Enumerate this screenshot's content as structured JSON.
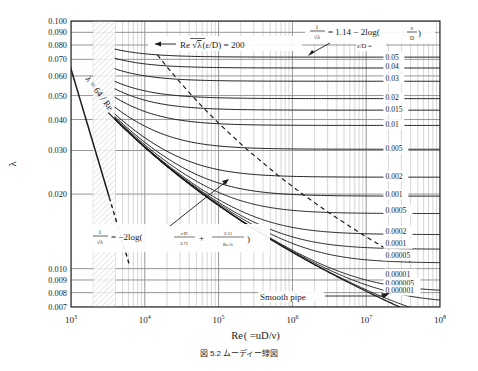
{
  "figure": {
    "caption": "図 5.2  ムーディー線図",
    "xlabel_re": "Re",
    "xlabel_rest": "( =uD/ν)",
    "ylabel": "λ"
  },
  "axes": {
    "x_ticks": [
      {
        "base": "10",
        "exp": "3",
        "value": 1000
      },
      {
        "base": "10",
        "exp": "4",
        "value": 10000
      },
      {
        "base": "10",
        "exp": "5",
        "value": 100000
      },
      {
        "base": "10",
        "exp": "6",
        "value": 1000000
      },
      {
        "base": "10",
        "exp": "7",
        "value": 10000000
      },
      {
        "base": "10",
        "exp": "8",
        "value": 100000000
      }
    ],
    "xlim": [
      1000,
      100000000
    ],
    "ylim": [
      0.007,
      0.1
    ],
    "y_ticks": [
      {
        "label": "0.100",
        "value": 0.1
      },
      {
        "label": "0.090",
        "value": 0.09
      },
      {
        "label": "0.080",
        "value": 0.08
      },
      {
        "label": "0.070",
        "value": 0.07
      },
      {
        "label": "0.060",
        "value": 0.06
      },
      {
        "label": "0.050",
        "value": 0.05
      },
      {
        "label": "0.040",
        "value": 0.04
      },
      {
        "label": "0.030",
        "value": 0.03
      },
      {
        "label": "0.020",
        "value": 0.02
      },
      {
        "label": "0.010",
        "value": 0.01
      },
      {
        "label": "0.009",
        "value": 0.009
      },
      {
        "label": "0.008",
        "value": 0.008
      },
      {
        "label": "0.007",
        "value": 0.007
      }
    ],
    "grid": true
  },
  "chart_data": {
    "type": "line",
    "title": "図 5.2  ムーディー線図",
    "xlabel": "Re( =uD/ν)",
    "ylabel": "λ",
    "xscale": "log",
    "yscale": "log",
    "xlim": [
      1000,
      100000000
    ],
    "ylim": [
      0.007,
      0.1
    ],
    "equation_colebrook": "1/√λ = −2log( (ε/D)/3.71 + 2.51/(Re√λ) )",
    "equation_laminar": "λ = 64/Re",
    "equation_vonkarman": "1/√λ = 1.14 − 2log(ε/D)",
    "transition_criterion": "Re√λ (ε/D) = 200",
    "smooth_pipe_label": "Smooth pipe",
    "eps_header": "ε/D =",
    "series": [
      {
        "name": "0.05",
        "eps": 0.05,
        "label": "0.05",
        "label_y": 0.0715
      },
      {
        "name": "0.04",
        "eps": 0.04,
        "label": "0.04",
        "label_y": 0.0655
      },
      {
        "name": "0.03",
        "eps": 0.03,
        "label": "0.03",
        "label_y": 0.0585
      },
      {
        "name": "0.02",
        "eps": 0.02,
        "label": "0.02",
        "label_y": 0.049
      },
      {
        "name": "0.015",
        "eps": 0.015,
        "label": "0.015",
        "label_y": 0.044
      },
      {
        "name": "0.01",
        "eps": 0.01,
        "label": "0.01",
        "label_y": 0.0382
      },
      {
        "name": "0.005",
        "eps": 0.005,
        "label": "0.005",
        "label_y": 0.0305
      },
      {
        "name": "0.002",
        "eps": 0.002,
        "label": "0.002",
        "label_y": 0.0236
      },
      {
        "name": "0.001",
        "eps": 0.001,
        "label": "0.001",
        "label_y": 0.0199
      },
      {
        "name": "0.0005",
        "eps": 0.0005,
        "label": "0.0005",
        "label_y": 0.0172
      },
      {
        "name": "0.0002",
        "eps": 0.0002,
        "label": "0.0002",
        "label_y": 0.0142
      },
      {
        "name": "0.0001",
        "eps": 0.0001,
        "label": "0.0001",
        "label_y": 0.0126
      },
      {
        "name": "0.00005",
        "eps": 5e-05,
        "label": "0.00005",
        "label_y": 0.0113
      },
      {
        "name": "0.00001",
        "eps": 1e-05,
        "label": "0.00001",
        "label_y": 0.0095
      },
      {
        "name": "0.000005",
        "eps": 5e-06,
        "label": "0.000005",
        "label_y": 0.00875
      },
      {
        "name": "0.000001",
        "eps": 1e-06,
        "label": "0.000001",
        "label_y": 0.00815
      }
    ],
    "laminar": {
      "from_re": 1000,
      "to_re": 3300,
      "formula": "64/Re"
    },
    "laminar_dashed": {
      "from_re": 3300,
      "to_re": 4300
    },
    "smooth": {
      "name": "smooth",
      "eps": 0.0
    }
  },
  "annotations": {
    "transition": {
      "re": "Re",
      "sqrt": "λ",
      "eps": "(ε/D)",
      "eq": "= 200"
    },
    "vonkarman": {
      "lhs_num": "1",
      "lhs_den": "λ",
      "rhs": "= 1.14 − 2log(",
      "eps_num": "ε",
      "eps_den": "D",
      "close": ")"
    },
    "colebrook": {
      "lhs_num": "1",
      "lhs_den": "λ",
      "rhs": "= −2log(",
      "t1_num": "ε/D",
      "t1_den": "3.71",
      "plus": "+",
      "t2_num": "2.51",
      "t2_den": "Re",
      "t2_den2": "λ",
      "close": ")"
    },
    "laminar_label": {
      "text": "λ = 64 / Re"
    },
    "smooth_pipe": {
      "text": "Smooth pipe"
    }
  },
  "colors": {
    "curve": "#1a1a1a",
    "grid_major": "#8a8a8a",
    "grid_minor": "#b4b4b4",
    "frame": "#1a1a1a",
    "background": "#ffffff",
    "hatch": "#c8c8c8"
  }
}
